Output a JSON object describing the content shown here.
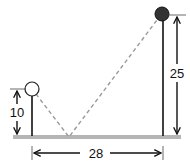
{
  "diagram": {
    "title": "",
    "labels": {
      "short_pole_height": "10",
      "tall_pole_height": "25",
      "distance_between_poles": "28"
    },
    "colors": {
      "ground": "#b5b5b5",
      "pole": "#111111",
      "dashed_path": "#9a9a9a",
      "short_pole_ball_fill": "#ffffff",
      "tall_pole_ball_fill": "#333333"
    },
    "elements": [
      {
        "name": "short-pole",
        "ball": "hollow",
        "height": 10
      },
      {
        "name": "tall-pole",
        "ball": "filled",
        "height": 25
      }
    ],
    "distance": 28
  }
}
